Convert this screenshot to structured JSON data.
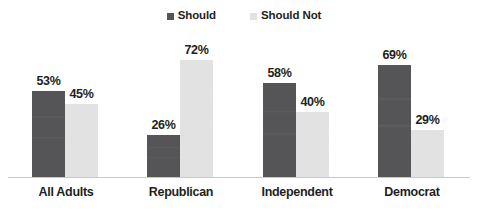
{
  "chart_data": {
    "type": "bar",
    "title": "",
    "subtitle": "",
    "xlabel": "",
    "ylabel": "",
    "ylim": [
      0,
      100
    ],
    "grid": false,
    "legend_position": "top-center",
    "categories": [
      "All Adults",
      "Republican",
      "Independent",
      "Democrat"
    ],
    "series": [
      {
        "name": "Should",
        "color": "#555557",
        "values": [
          53,
          26,
          58,
          69
        ],
        "labels": [
          "53%",
          "26%",
          "58%",
          "69%"
        ]
      },
      {
        "name": "Should Not",
        "color": "#e2e2e2",
        "values": [
          45,
          72,
          40,
          29
        ],
        "labels": [
          "45%",
          "72%",
          "40%",
          "29%"
        ]
      }
    ]
  },
  "legend": {
    "items": [
      {
        "label": "Should",
        "color": "#555557",
        "swatch": "square-swatch-dark"
      },
      {
        "label": "Should Not",
        "color": "#e2e2e2",
        "swatch": "square-swatch-light"
      }
    ]
  },
  "axis": {
    "baseline_color": "#c9c9c9"
  },
  "groups": [
    {
      "category": "All Adults",
      "should": {
        "value": 53,
        "label": "53%"
      },
      "should_not": {
        "value": 45,
        "label": "45%"
      }
    },
    {
      "category": "Republican",
      "should": {
        "value": 26,
        "label": "26%"
      },
      "should_not": {
        "value": 72,
        "label": "72%"
      }
    },
    {
      "category": "Independent",
      "should": {
        "value": 58,
        "label": "58%"
      },
      "should_not": {
        "value": 40,
        "label": "40%"
      }
    },
    {
      "category": "Democrat",
      "should": {
        "value": 69,
        "label": "69%"
      },
      "should_not": {
        "value": 29,
        "label": "29%"
      }
    }
  ]
}
